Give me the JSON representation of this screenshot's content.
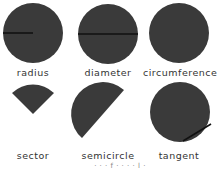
{
  "figure": {
    "fill_color": "#3a3a3a",
    "line_color": "#111111",
    "items": [
      {
        "label": "radius"
      },
      {
        "label": "diameter"
      },
      {
        "label": "circumference"
      },
      {
        "label": "sector"
      },
      {
        "label": "semicircle"
      },
      {
        "label": "tangent"
      }
    ],
    "footer_fragment": "· · · f · · · · l ·"
  }
}
